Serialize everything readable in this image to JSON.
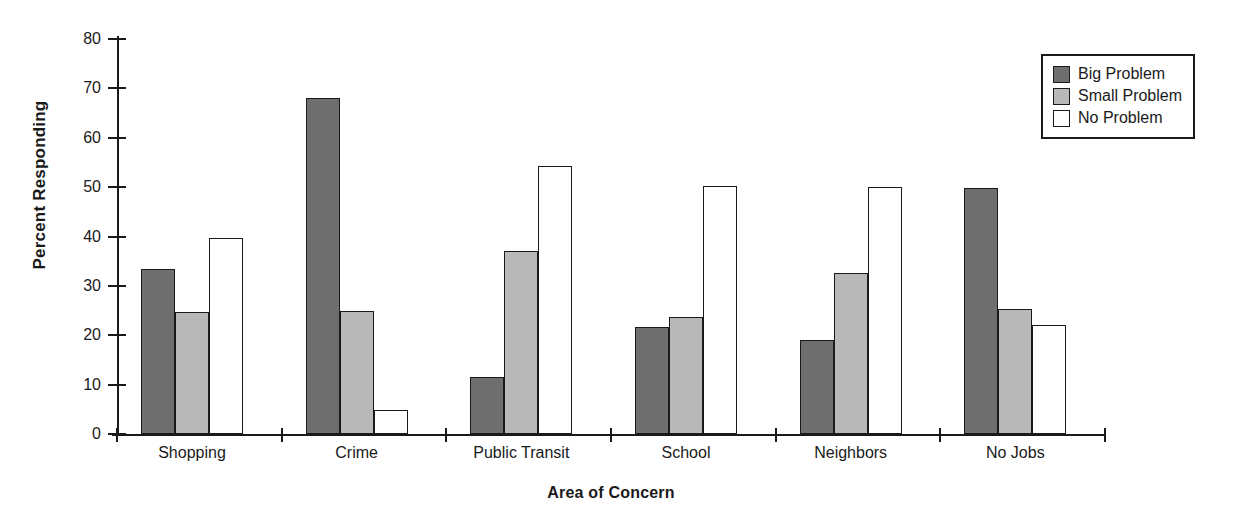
{
  "chart_data": {
    "type": "bar",
    "title": "",
    "xlabel": "Area of Concern",
    "ylabel": "Percent Responding",
    "categories": [
      "Shopping",
      "Crime",
      "Public Transit",
      "School",
      "Neighbors",
      "No Jobs"
    ],
    "series": [
      {
        "name": "Big Problem",
        "color": "#6e6e6e",
        "values": [
          33.5,
          68.0,
          11.6,
          21.6,
          19.1,
          49.8
        ]
      },
      {
        "name": "Small Problem",
        "color": "#b8b8b8",
        "values": [
          24.7,
          25.0,
          37.0,
          23.6,
          32.7,
          25.4
        ]
      },
      {
        "name": "No Problem",
        "color": "#ffffff",
        "values": [
          39.7,
          4.9,
          54.2,
          50.3,
          50.0,
          22.0
        ]
      }
    ],
    "ylim": [
      0,
      80
    ],
    "yticks": [
      0,
      10,
      20,
      30,
      40,
      50,
      60,
      70,
      80
    ],
    "ytick_labels": [
      "0",
      "10",
      "20",
      "30",
      "40",
      "50",
      "60",
      "70",
      "80"
    ],
    "grid": false,
    "legend_position": "top-right",
    "legend_entries": [
      "Big Problem",
      "Small Problem",
      "No Problem"
    ],
    "axis_color": "#1a1a1a",
    "background_color": "#ffffff"
  }
}
